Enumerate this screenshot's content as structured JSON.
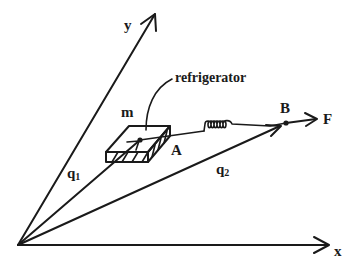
{
  "diagram": {
    "axes": {
      "x_label": "x",
      "y_label": "y"
    },
    "vectors": {
      "q1_label": "q",
      "q1_sub": "1",
      "q2_label": "q",
      "q2_sub": "2"
    },
    "objects": {
      "mass_label": "m",
      "box_annotation": "refrigerator",
      "point_a_label": "A",
      "point_b_label": "B",
      "force_label": "F"
    },
    "colors": {
      "stroke": "#1a1a1a",
      "background": "#ffffff"
    }
  }
}
